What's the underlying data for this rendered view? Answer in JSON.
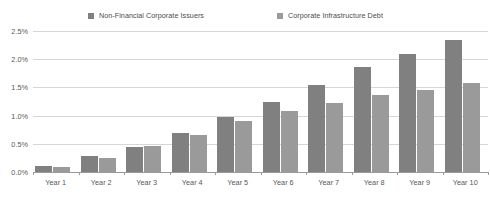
{
  "chart_data": {
    "type": "bar",
    "title": "",
    "subtitle": "",
    "xlabel": "",
    "ylabel": "",
    "categories": [
      "Year 1",
      "Year 2",
      "Year 3",
      "Year 4",
      "Year 5",
      "Year 6",
      "Year 7",
      "Year 8",
      "Year 9",
      "Year 10"
    ],
    "series": [
      {
        "name": "Non-Financial Corporate Issuers",
        "color": "#808080",
        "values": [
          0.1,
          0.28,
          0.45,
          0.7,
          0.98,
          1.24,
          1.54,
          1.86,
          2.1,
          2.34
        ]
      },
      {
        "name": "Corporate Infrastructure Debt",
        "color": "#9a9a9a",
        "values": [
          0.09,
          0.25,
          0.47,
          0.65,
          0.91,
          1.08,
          1.22,
          1.37,
          1.45,
          1.57
        ]
      }
    ],
    "ylim": [
      0.0,
      2.5
    ],
    "ytick_values": [
      0.0,
      0.5,
      1.0,
      1.5,
      2.0,
      2.5
    ],
    "ytick_labels": [
      "0.0%",
      "0.5%",
      "1.0%",
      "1.5%",
      "2.0%",
      "2.5%"
    ],
    "grid": true,
    "grid_axis": "y",
    "legend_position": "top",
    "value_unit": "%"
  }
}
